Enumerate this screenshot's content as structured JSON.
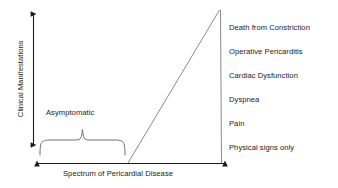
{
  "figure": {
    "axes": {
      "y_title": "Clinical Manifestations",
      "x_title": "Spectrum of Pericardial Disease"
    },
    "annotations": {
      "asymptomatic": "Asymptomatic"
    },
    "manifestations": [
      "Death from Constriction",
      "Operative Pericarditis",
      "Cardiac Dysfunction",
      "Dyspnea",
      "Pain",
      "Physical signs only"
    ],
    "colors": {
      "axis": "#1a1a1a",
      "curve": "#8a8a8a",
      "brace": "#6f6f6f",
      "text": "#1a1a1a",
      "background": "#ffffff"
    }
  }
}
